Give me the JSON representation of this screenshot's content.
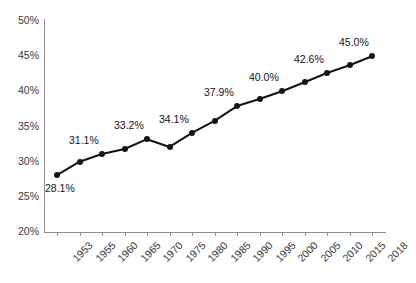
{
  "chart_data": {
    "type": "line",
    "title": "",
    "subtitle": "",
    "xlabel": "",
    "ylabel": "",
    "categories": [
      "1953",
      "1955",
      "1960",
      "1965",
      "1970",
      "1975",
      "1980",
      "1985",
      "1990",
      "1995",
      "2000",
      "2005",
      "2010",
      "2015",
      "2018"
    ],
    "values": [
      28.1,
      30.0,
      31.1,
      31.8,
      33.2,
      32.1,
      34.1,
      35.8,
      37.9,
      38.9,
      40.0,
      41.3,
      42.6,
      43.7,
      45.0
    ],
    "point_labels": [
      "28.1%",
      "",
      "31.1%",
      "",
      "33.2%",
      "",
      "34.1%",
      "",
      "37.9%",
      "",
      "40.0%",
      "",
      "42.6%",
      "",
      "45.0%"
    ],
    "ylim": [
      20,
      50
    ],
    "ytick_values": [
      20,
      25,
      30,
      35,
      40,
      45,
      50
    ],
    "ytick_labels": [
      "20%",
      "25%",
      "30%",
      "35%",
      "40%",
      "45%",
      "50%"
    ],
    "grid": false,
    "legend": false,
    "legend_position": "none",
    "series_color": "#141414",
    "axis_color": "#8d8d8d",
    "text_color": "#3a3a3a",
    "background_color": "#ffffff",
    "marker": "filled-circle",
    "xtick_label_rotation": -45
  }
}
